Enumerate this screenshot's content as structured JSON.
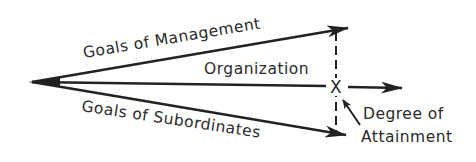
{
  "diagram": {
    "labels": {
      "goals_management": "Goals of Management",
      "organization": "Organization",
      "goals_subordinates": "Goals of Subordinates",
      "degree_line1": "Degree of",
      "degree_line2": "Attainment"
    },
    "marker": "X",
    "colors": {
      "ink": "#222222",
      "background": "#ffffff"
    }
  }
}
